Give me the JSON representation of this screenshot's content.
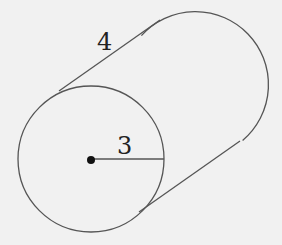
{
  "diagram": {
    "shape": "cylinder",
    "length_label": "4",
    "radius_label": "3",
    "colors": {
      "background": "#f1f1f1",
      "stroke": "#555555",
      "center_dot": "#111111"
    }
  }
}
